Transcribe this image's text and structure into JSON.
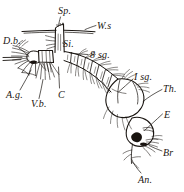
{
  "figure": {
    "ink_color": "#191410",
    "background_color": "#ffffff"
  },
  "labels": [
    {
      "key": "sp",
      "text": "Sp.",
      "meaning": "spiracle",
      "x": 58,
      "y": 6
    },
    {
      "key": "ws",
      "text": "W.s",
      "meaning": "water surface",
      "x": 97,
      "y": 21
    },
    {
      "key": "db",
      "text": "D.b.",
      "meaning": "dorsal brush",
      "x": 3,
      "y": 36
    },
    {
      "key": "si",
      "text": "Si.",
      "meaning": "siphon",
      "x": 63,
      "y": 39
    },
    {
      "key": "8sg",
      "text": "8 sg.",
      "meaning": "eighth segment",
      "x": 90,
      "y": 50
    },
    {
      "key": "isg",
      "text": "I sg.",
      "meaning": "first segment",
      "x": 134,
      "y": 72
    },
    {
      "key": "th",
      "text": "Th.",
      "meaning": "thorax",
      "x": 163,
      "y": 84
    },
    {
      "key": "ag",
      "text": "A.g.",
      "meaning": "anal gills",
      "x": 6,
      "y": 90
    },
    {
      "key": "vb",
      "text": "V.b.",
      "meaning": "ventral brush",
      "x": 31,
      "y": 99
    },
    {
      "key": "c",
      "text": "C",
      "meaning": "comb",
      "x": 58,
      "y": 90
    },
    {
      "key": "e",
      "text": "E",
      "meaning": "eye",
      "x": 164,
      "y": 110
    },
    {
      "key": "br",
      "text": "Br",
      "meaning": "mouth brush",
      "x": 163,
      "y": 148
    },
    {
      "key": "an",
      "text": "An.",
      "meaning": "antenna",
      "x": 138,
      "y": 175
    }
  ]
}
